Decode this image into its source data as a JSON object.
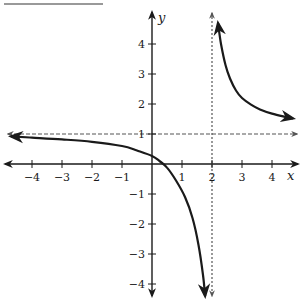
{
  "header": {
    "title_text": "",
    "underline": true
  },
  "colors": {
    "ink": "#1a1a1a",
    "asymptote": "#555555",
    "background": "#ffffff"
  },
  "chart_data": {
    "type": "line",
    "title": "",
    "xlabel": "x",
    "ylabel": "y",
    "xlim": [
      -4.8,
      4.9
    ],
    "ylim": [
      -4.4,
      5.0
    ],
    "grid": false,
    "x_ticks": [
      -4,
      -3,
      -2,
      -1,
      1,
      2,
      3,
      4
    ],
    "x_tick_labels": [
      "−4",
      "−3",
      "−2",
      "−1",
      "1",
      "2",
      "3",
      "4"
    ],
    "y_ticks": [
      4,
      3,
      2,
      1,
      -1,
      -2,
      -3,
      -4
    ],
    "y_tick_labels": [
      "4",
      "3",
      "2",
      "1",
      "−1",
      "−2",
      "−3",
      "−4"
    ],
    "asymptotes": {
      "vertical": {
        "x": 2,
        "style": "dashed"
      },
      "horizontal": {
        "y": 1,
        "style": "dashed"
      }
    },
    "series": [
      {
        "name": "left-branch",
        "x": [
          -4.7,
          -4.0,
          -3.0,
          -2.0,
          -1.0,
          -0.5,
          0.0,
          0.25,
          0.5,
          0.8,
          1.1,
          1.35,
          1.55,
          1.7,
          1.77
        ],
        "y": [
          0.92,
          0.88,
          0.82,
          0.74,
          0.6,
          0.45,
          0.27,
          0.1,
          -0.12,
          -0.55,
          -1.1,
          -1.8,
          -2.7,
          -3.7,
          -4.4
        ],
        "arrows": "both"
      },
      {
        "name": "right-branch",
        "x": [
          2.2,
          2.3,
          2.45,
          2.6,
          2.8,
          3.0,
          3.3,
          3.6,
          4.0,
          4.4,
          4.7
        ],
        "y": [
          4.7,
          4.0,
          3.3,
          2.85,
          2.45,
          2.2,
          1.98,
          1.82,
          1.68,
          1.58,
          1.52
        ],
        "arrows": "both"
      }
    ]
  }
}
